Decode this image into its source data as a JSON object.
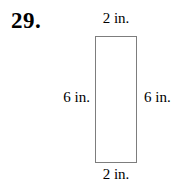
{
  "figure": {
    "problem_number": "29.",
    "shape": "rectangle",
    "dimension_labels": {
      "top": "2 in.",
      "bottom": "2 in.",
      "left": "6 in.",
      "right": "6 in."
    }
  },
  "colors": {
    "background": "#ffffff",
    "text": "#000000",
    "rectangle_border": "#7d7d7d"
  }
}
